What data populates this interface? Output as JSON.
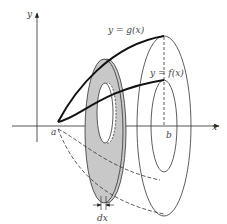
{
  "diagram": {
    "type": "solid-of-revolution-washer",
    "labels": {
      "y_axis": "y",
      "x_axis": "x",
      "upper_curve": "y = g(x)",
      "lower_curve": "y = f(x)",
      "left_bound": "a",
      "right_bound": "b",
      "thickness": "dx"
    },
    "colors": {
      "line": "#111111",
      "washer_fill": "#c8c8c8",
      "label": "#444444",
      "background": "#ffffff"
    }
  }
}
